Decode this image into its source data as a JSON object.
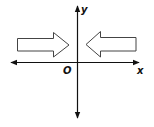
{
  "diagram": {
    "type": "coordinate-plane",
    "labels": {
      "x_axis": "x",
      "y_axis": "y",
      "origin": "O"
    },
    "arrows": [
      {
        "name": "left-arrow",
        "direction": "right",
        "description": "Hollow block arrow left of y-axis pointing toward the y-axis"
      },
      {
        "name": "right-arrow",
        "direction": "left",
        "description": "Hollow block arrow right of y-axis pointing toward the y-axis"
      }
    ],
    "colors": {
      "stroke": "#111111",
      "arrow_stroke": "#444444",
      "background": "#ffffff"
    }
  }
}
